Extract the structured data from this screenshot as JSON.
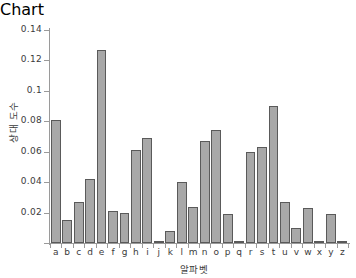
{
  "chart_data": {
    "type": "bar",
    "title": "",
    "subtitle": "",
    "xlabel": "알파벳",
    "ylabel": "상대 도수",
    "categories": [
      "a",
      "b",
      "c",
      "d",
      "e",
      "f",
      "g",
      "h",
      "i",
      "j",
      "k",
      "l",
      "m",
      "n",
      "o",
      "p",
      "q",
      "r",
      "s",
      "t",
      "u",
      "v",
      "w",
      "x",
      "y",
      "z"
    ],
    "values": [
      0.081,
      0.015,
      0.027,
      0.042,
      0.127,
      0.021,
      0.02,
      0.061,
      0.069,
      0.0005,
      0.008,
      0.04,
      0.024,
      0.067,
      0.074,
      0.019,
      0.001,
      0.06,
      0.063,
      0.09,
      0.027,
      0.01,
      0.023,
      0.0015,
      0.019,
      0.0005
    ],
    "ylim": [
      0,
      0.14
    ],
    "xlim_categories": 26,
    "ytick_labels": [
      "0.02",
      "0.04",
      "0.06",
      "0.08",
      "0.1",
      "0.12",
      "0.14"
    ],
    "ytick_values": [
      0.02,
      0.04,
      0.06,
      0.08,
      0.1,
      0.12,
      0.14
    ],
    "grid": false,
    "legend": null,
    "legend_position": "none",
    "bar_fill_color": "#a8a8a8",
    "bar_edge_color": "#5a5a5a",
    "axis_color": "#9a9a9a",
    "text_color": "#3b3b3b",
    "background_color": "#ffffff"
  }
}
